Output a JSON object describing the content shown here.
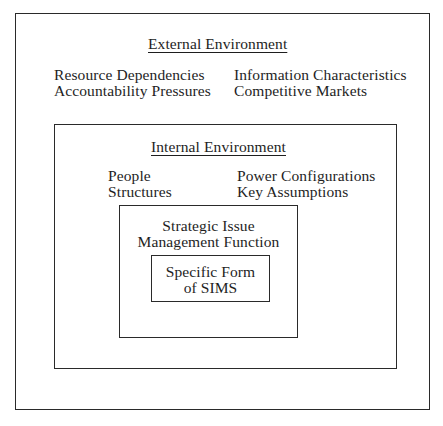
{
  "diagram": {
    "type": "nested-boxes",
    "external": {
      "title": "External Environment",
      "left_items": [
        "Resource Dependencies",
        "Accountability Pressures"
      ],
      "right_items": [
        "Information Characteristics",
        "Competitive Markets"
      ]
    },
    "internal": {
      "title": "Internal Environment",
      "left_items": [
        "People",
        "Structures"
      ],
      "right_items": [
        "Power Configurations",
        "Key Assumptions"
      ]
    },
    "function": {
      "lines": [
        "Strategic Issue",
        "Management Function"
      ]
    },
    "form": {
      "lines": [
        "Specific Form",
        "of SIMS"
      ]
    }
  }
}
